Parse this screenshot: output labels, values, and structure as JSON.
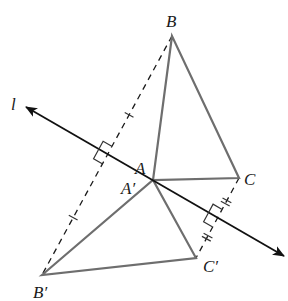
{
  "diagram": {
    "type": "reflection-across-line",
    "colors": {
      "background": "#ffffff",
      "line_l": "#111111",
      "triangle": "#6e6e6e",
      "dashed": "#1a1a1a",
      "marks": "#333333",
      "label": "#1a1a1a"
    },
    "line_l": {
      "label": "l",
      "start": [
        26,
        107
      ],
      "end": [
        284,
        256
      ],
      "label_pos": [
        11,
        110
      ]
    },
    "points": {
      "B": {
        "label": "B",
        "xy": [
          172,
          36
        ],
        "label_pos": [
          166,
          27
        ]
      },
      "A": {
        "label": "A",
        "xy": [
          153,
          180
        ],
        "label_pos": [
          135,
          174
        ]
      },
      "C": {
        "label": "C",
        "xy": [
          239,
          178
        ],
        "label_pos": [
          244,
          185
        ]
      },
      "A_prime": {
        "label": "A′",
        "xy": [
          153,
          180
        ],
        "label_pos": [
          121,
          194
        ]
      },
      "B_prime": {
        "label": "B′",
        "xy": [
          42,
          275
        ],
        "label_pos": [
          33,
          298
        ]
      },
      "C_prime": {
        "label": "C′",
        "xy": [
          196,
          258
        ],
        "label_pos": [
          203,
          272
        ]
      }
    },
    "triangle_original": [
      "B",
      "A",
      "C"
    ],
    "triangle_image": [
      "B_prime",
      "A_prime",
      "C_prime"
    ],
    "dashed_segments": [
      {
        "from": "B",
        "to": "B_prime",
        "tick_marks": 1,
        "tick_positions": [
          0.33,
          0.76
        ]
      },
      {
        "from": "C",
        "to": "C_prime",
        "tick_marks": 2,
        "tick_positions": [
          0.3,
          0.74
        ]
      }
    ],
    "right_angle_marks": [
      {
        "at": [
          107,
          155
        ],
        "near": "BB′"
      },
      {
        "at": [
          217,
          218
        ],
        "near": "CC′"
      }
    ]
  }
}
